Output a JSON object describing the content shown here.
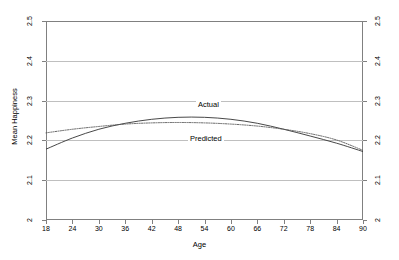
{
  "chart_data": {
    "type": "line",
    "title": "",
    "xlabel": "Age",
    "ylabel": "Mean Happiness",
    "xlim": [
      18,
      90
    ],
    "ylim": [
      2,
      2.5
    ],
    "grid": true,
    "legend_position": "inline-annotations",
    "x_ticks": [
      "18",
      "24",
      "30",
      "36",
      "42",
      "48",
      "54",
      "60",
      "66",
      "72",
      "78",
      "84",
      "90"
    ],
    "y_ticks": [
      "2.5",
      "2.4",
      "2.3",
      "2.2",
      "2.1",
      "2"
    ],
    "y_ticks_right": [
      "2.5",
      "2.4",
      "2.3",
      "2.2",
      "2.1",
      "2"
    ],
    "x": [
      18,
      24,
      30,
      36,
      42,
      48,
      54,
      60,
      66,
      72,
      78,
      84,
      90
    ],
    "series": [
      {
        "name": "Actual",
        "style": "solid",
        "color": "#333333",
        "values": [
          2.178,
          2.206,
          2.228,
          2.243,
          2.253,
          2.258,
          2.258,
          2.253,
          2.243,
          2.228,
          2.211,
          2.193,
          2.172
        ]
      },
      {
        "name": "Predicted",
        "style": "dotted",
        "color": "#555555",
        "values": [
          2.219,
          2.228,
          2.235,
          2.241,
          2.244,
          2.245,
          2.244,
          2.241,
          2.236,
          2.228,
          2.217,
          2.201,
          2.175
        ]
      }
    ],
    "annotations": [
      {
        "text": "Actual",
        "x": 52,
        "y": 2.3
      },
      {
        "text": "Predicted",
        "x": 48,
        "y": 2.22
      }
    ]
  },
  "axes": {
    "y_title": "Mean Happiness",
    "x_title": "Age",
    "y_tick_labels": [
      "2.5",
      "2.4",
      "2.3",
      "2.2",
      "2.1",
      "2"
    ],
    "x_tick_labels": [
      "18",
      "24",
      "30",
      "36",
      "42",
      "48",
      "54",
      "60",
      "66",
      "72",
      "78",
      "84",
      "90"
    ]
  },
  "labels": {
    "actual": "Actual",
    "predicted": "Predicted"
  },
  "colors": {
    "background": "#ffffff",
    "frame": "#808080",
    "gridline": "#bfbfbf",
    "actual_line": "#333333",
    "predicted_line": "#555555",
    "text": "#000000"
  }
}
